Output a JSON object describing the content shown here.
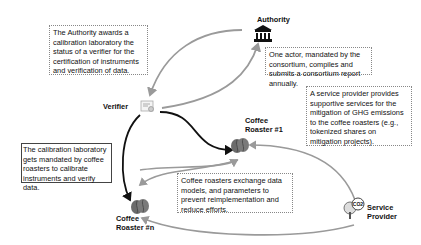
{
  "actors": {
    "authority": {
      "label": "Authority",
      "icon": "bank-building-icon"
    },
    "verifier": {
      "label": "Verifier",
      "icon": "certificate-document-icon"
    },
    "roaster1": {
      "label_line1": "Coffee",
      "label_line2": "Roaster #1",
      "icon": "coffee-bean-icon"
    },
    "roastern": {
      "label_line1": "Coffee",
      "label_line2": "Roaster #n",
      "icon": "coffee-bean-icon"
    },
    "service_provider": {
      "label_line1": "Service",
      "label_line2": "Provider",
      "icon": "co2-tree-icon",
      "icon_text": "CO2"
    }
  },
  "notes": {
    "authority_awards": "The Authority awards a calibration laboratory the status of a verifier for the certification of  instruments and verification of data.",
    "consortium_report": "One actor, mandated by the consortium, compiles and submits a consortium report annually.",
    "service_provider": "A service provider provides supportive services for the mitigation of GHG emissions to the coffee roasters (e.g., tokenized shares on mitigation projects).",
    "calibration_lab": "The calibration laboratory gets mandated by coffee roasters to calibrate instruments and verify data.",
    "data_exchange": "Coffee roasters exchange data models, and parameters to prevent reimplementation and reduce efforts."
  },
  "colors": {
    "grey_arrow": "#9a9a9a",
    "black_arrow": "#111111",
    "bean": "#6b6b6b"
  }
}
